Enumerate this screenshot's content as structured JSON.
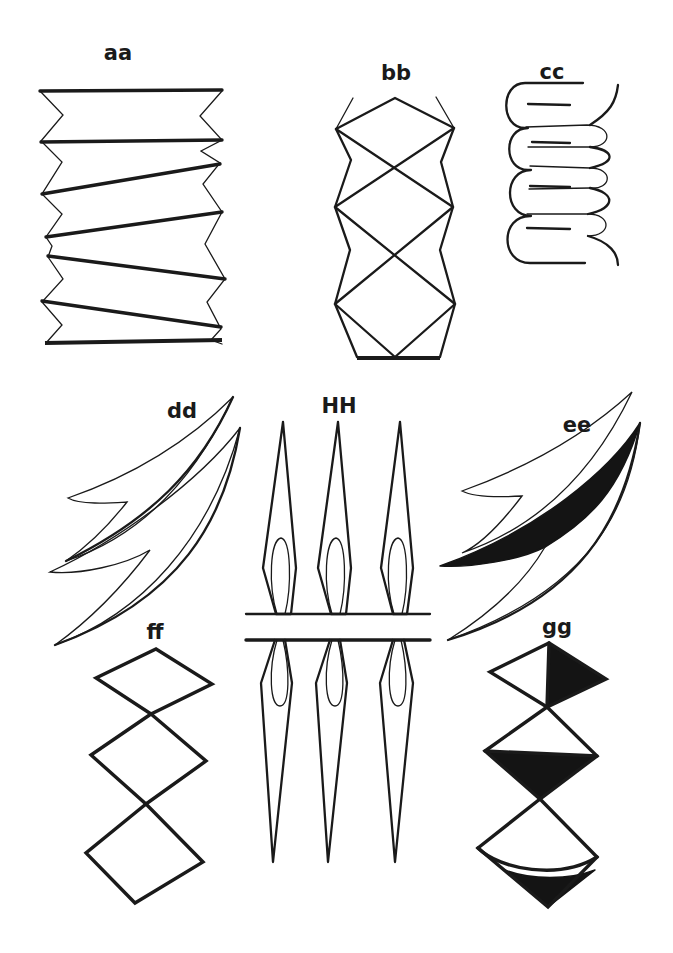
{
  "figure": {
    "ink_color": "#1a1a1a",
    "background_color": "#ffffff",
    "panels": [
      {
        "id": "aa",
        "label": "aa",
        "shape": "accordion zig-zag fold with slanted heavy bars"
      },
      {
        "id": "bb",
        "label": "bb",
        "shape": "column of crossed diamonds with zig-zag sides and heavy base"
      },
      {
        "id": "cc",
        "label": "cc",
        "shape": "serpentine folded strip"
      },
      {
        "id": "dd",
        "label": "dd",
        "shape": "two nested curved barbed blades (outline)"
      },
      {
        "id": "HH",
        "label": "HH",
        "shape": "three mirrored spear/flame shapes above and below two horizontal bars"
      },
      {
        "id": "ee",
        "label": "ee",
        "shape": "two nested curved barbed blades with shaded inner sliver"
      },
      {
        "id": "ff",
        "label": "ff",
        "shape": "three stacked diamonds (outline)"
      },
      {
        "id": "gg",
        "label": "gg",
        "shape": "three stacked diamonds with shaded triangular halves"
      }
    ]
  }
}
